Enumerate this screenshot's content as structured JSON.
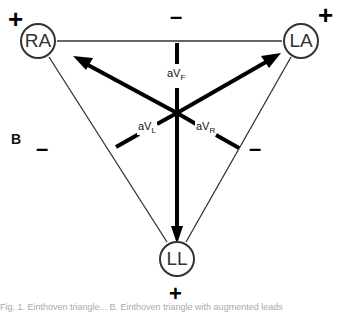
{
  "figure": {
    "panel_label": "B",
    "nodes": {
      "ra": "RA",
      "la": "LA",
      "ll": "LL"
    },
    "leads": {
      "avf": {
        "base": "aV",
        "sub": "F"
      },
      "avl": {
        "base": "aV",
        "sub": "L"
      },
      "avr": {
        "base": "aV",
        "sub": "R"
      }
    },
    "signs": {
      "ra_plus": "+",
      "la_plus": "+",
      "ll_plus": "+",
      "top_minus": "–",
      "left_minus": "–",
      "right_minus": "–"
    },
    "colors": {
      "thick_line": "#000000",
      "thin_line": "#333333",
      "background": "#ffffff"
    },
    "caption": "Fig. 1. Einthoven triangle... B. Einthoven triangle with augmented leads"
  }
}
